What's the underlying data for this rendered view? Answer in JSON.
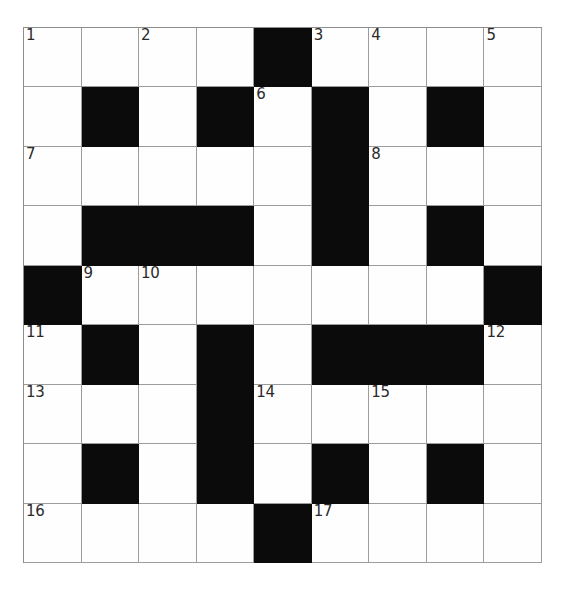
{
  "puzzle": {
    "type": "crossword-grid",
    "title": "",
    "rows": 9,
    "columns": 9,
    "colors": {
      "background": "#ffffff",
      "cell_fill": "#fefefe",
      "block_fill": "#0b0b0b",
      "grid_line": "#9c9c9c",
      "number_text": "#2a2a2a"
    },
    "legend": {
      "white": "open letter cell",
      "black": "blocked cell"
    },
    "clue_numbers": [
      1,
      2,
      3,
      4,
      5,
      6,
      7,
      8,
      9,
      10,
      11,
      12,
      13,
      14,
      15,
      16,
      17
    ],
    "numbered_cells": [
      {
        "number": "1",
        "row": 0,
        "col": 0
      },
      {
        "number": "2",
        "row": 0,
        "col": 2
      },
      {
        "number": "3",
        "row": 0,
        "col": 5
      },
      {
        "number": "4",
        "row": 0,
        "col": 6
      },
      {
        "number": "5",
        "row": 0,
        "col": 8
      },
      {
        "number": "6",
        "row": 1,
        "col": 4
      },
      {
        "number": "7",
        "row": 2,
        "col": 0
      },
      {
        "number": "8",
        "row": 2,
        "col": 6
      },
      {
        "number": "9",
        "row": 4,
        "col": 1
      },
      {
        "number": "10",
        "row": 4,
        "col": 2
      },
      {
        "number": "11",
        "row": 5,
        "col": 0
      },
      {
        "number": "12",
        "row": 5,
        "col": 8
      },
      {
        "number": "13",
        "row": 6,
        "col": 0
      },
      {
        "number": "14",
        "row": 6,
        "col": 4
      },
      {
        "number": "15",
        "row": 6,
        "col": 6
      },
      {
        "number": "16",
        "row": 8,
        "col": 0
      },
      {
        "number": "17",
        "row": 8,
        "col": 5
      }
    ],
    "grid": [
      [
        "white",
        "white",
        "white",
        "white",
        "black",
        "white",
        "white",
        "white",
        "white"
      ],
      [
        "white",
        "black",
        "white",
        "black",
        "white",
        "black",
        "white",
        "black",
        "white"
      ],
      [
        "white",
        "white",
        "white",
        "white",
        "white",
        "black",
        "white",
        "white",
        "white"
      ],
      [
        "white",
        "black",
        "black",
        "black",
        "white",
        "black",
        "white",
        "black",
        "white"
      ],
      [
        "black",
        "white",
        "white",
        "white",
        "white",
        "white",
        "white",
        "white",
        "black"
      ],
      [
        "white",
        "black",
        "white",
        "black",
        "white",
        "black",
        "black",
        "black",
        "white"
      ],
      [
        "white",
        "white",
        "white",
        "black",
        "white",
        "white",
        "white",
        "white",
        "white"
      ],
      [
        "white",
        "black",
        "white",
        "black",
        "white",
        "black",
        "white",
        "black",
        "white"
      ],
      [
        "white",
        "white",
        "white",
        "white",
        "black",
        "white",
        "white",
        "white",
        "white"
      ]
    ],
    "entries": []
  }
}
